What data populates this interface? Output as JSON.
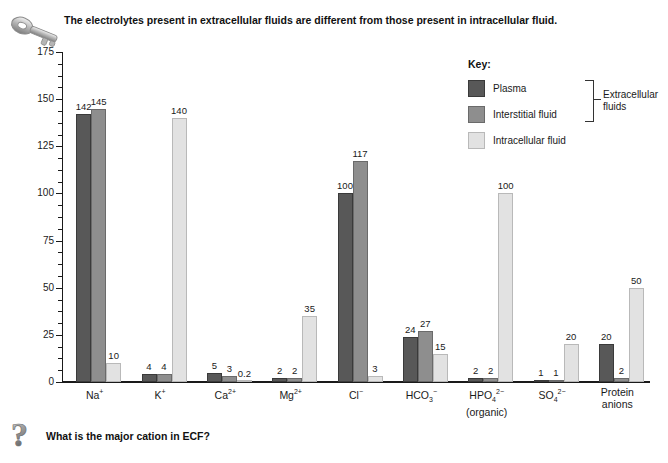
{
  "caption": {
    "text": "The electrolytes present in extracellular fluids are different from those present in intracellular fluid.",
    "icon": "key-icon"
  },
  "question": {
    "text": "What is the major cation in ECF?",
    "icon": "question-mark-icon"
  },
  "legend": {
    "title": "Key:",
    "items": [
      {
        "label": "Plasma",
        "color": "#585858"
      },
      {
        "label": "Interstitial fluid",
        "color": "#8e8e8e"
      },
      {
        "label": "Intracellular fluid",
        "color": "#e2e2e2"
      }
    ],
    "bracket_label": "Extracellular\nfluids",
    "bracket_label_line1": "Extracellular",
    "bracket_label_line2": "fluids"
  },
  "chart_data": {
    "type": "bar",
    "title": "",
    "xlabel": "",
    "ylabel": "mEq/liter",
    "ylim": [
      0,
      175
    ],
    "yticks": [
      0,
      25,
      50,
      75,
      100,
      125,
      150,
      175
    ],
    "ytick_labels": [
      "0",
      "25",
      "50",
      "75",
      "100",
      "125",
      "150",
      "175"
    ],
    "minor_tick_step": 6.25,
    "grid": false,
    "legend_position": "upper-right",
    "categories": [
      "Na+",
      "K+",
      "Ca2+",
      "Mg2+",
      "Cl-",
      "HCO3-",
      "HPO4 2- (organic)",
      "SO4 2-",
      "Protein anions"
    ],
    "category_labels": [
      {
        "base": "Na",
        "sup": "+",
        "sub": "",
        "line2": ""
      },
      {
        "base": "K",
        "sup": "+",
        "sub": "",
        "line2": ""
      },
      {
        "base": "Ca",
        "sup": "2+",
        "sub": "",
        "line2": ""
      },
      {
        "base": "Mg",
        "sup": "2+",
        "sub": "",
        "line2": ""
      },
      {
        "base": "Cl",
        "sup": "−",
        "sub": "",
        "line2": ""
      },
      {
        "base": "HCO",
        "sup": "−",
        "sub": "3",
        "line2": ""
      },
      {
        "base": "HPO",
        "sup": "2−",
        "sub": "4",
        "line2": "(organic)"
      },
      {
        "base": "SO",
        "sup": "2−",
        "sub": "4",
        "line2": ""
      },
      {
        "base": "Protein",
        "sup": "",
        "sub": "",
        "line2": "anions"
      }
    ],
    "series": [
      {
        "name": "Plasma",
        "color": "#585858",
        "values": [
          142,
          4,
          5,
          2,
          100,
          24,
          2,
          1,
          20
        ],
        "labels": [
          "142",
          "4",
          "5",
          "2",
          "100",
          "24",
          "2",
          "1",
          "20"
        ]
      },
      {
        "name": "Interstitial fluid",
        "color": "#8e8e8e",
        "values": [
          145,
          4,
          3,
          2,
          117,
          27,
          2,
          1,
          2
        ],
        "labels": [
          "145",
          "4",
          "3",
          "2",
          "117",
          "27",
          "2",
          "1",
          "2"
        ]
      },
      {
        "name": "Intracellular fluid",
        "color": "#e2e2e2",
        "values": [
          10,
          140,
          0.2,
          35,
          3,
          15,
          100,
          20,
          50
        ],
        "labels": [
          "10",
          "140",
          "0.2",
          "35",
          "3",
          "15",
          "100",
          "20",
          "50"
        ]
      }
    ]
  }
}
